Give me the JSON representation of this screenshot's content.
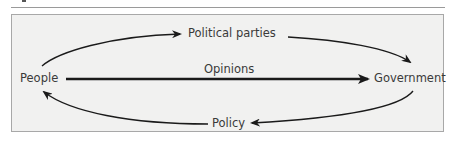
{
  "diagram": {
    "nodes": {
      "people": "People",
      "government": "Government",
      "political_parties": "Political parties",
      "policy": "Policy"
    },
    "edges": {
      "opinions": "Opinions"
    },
    "colors": {
      "background": "#f1f1f0",
      "border": "#a8a8a8",
      "text": "#3a3a3a",
      "arrow": "#1a1a1a"
    },
    "flows": [
      {
        "from": "People",
        "to": "Political parties",
        "style": "curved arrow"
      },
      {
        "from": "Political parties",
        "to": "Government",
        "style": "curved arrow"
      },
      {
        "from": "People",
        "to": "Government",
        "label": "Opinions",
        "style": "thick straight arrow"
      },
      {
        "from": "Government",
        "to": "Policy",
        "style": "curved arrow"
      },
      {
        "from": "Policy",
        "to": "People",
        "style": "curved arrow"
      }
    ]
  }
}
